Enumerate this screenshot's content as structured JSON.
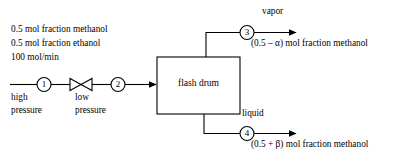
{
  "diagram": {
    "type": "process-flow-diagram",
    "colors": {
      "line": "#000000",
      "background": "#ffffff",
      "text": "#000000"
    },
    "feed": {
      "spec_lines": [
        "0.5 mol fraction methanol",
        "0.5 mol fraction ethanol",
        "100 mol/min"
      ],
      "upstream_label_lines": [
        "high",
        "pressure"
      ],
      "downstream_label_lines": [
        "low",
        "pressure"
      ]
    },
    "unit": {
      "label": "flash drum"
    },
    "valve": {
      "name": "throttling-valve"
    },
    "streams": [
      {
        "number": "1",
        "name": "feed-high-pressure"
      },
      {
        "number": "2",
        "name": "feed-low-pressure"
      },
      {
        "number": "3",
        "name": "vapor-outlet"
      },
      {
        "number": "4",
        "name": "liquid-outlet"
      }
    ],
    "outlets": {
      "vapor": {
        "label": "vapor",
        "composition": "(0.5 – α) mol fraction methanol"
      },
      "liquid": {
        "label": "liquid",
        "composition": "(0.5 + β) mol fraction methanol"
      }
    }
  }
}
